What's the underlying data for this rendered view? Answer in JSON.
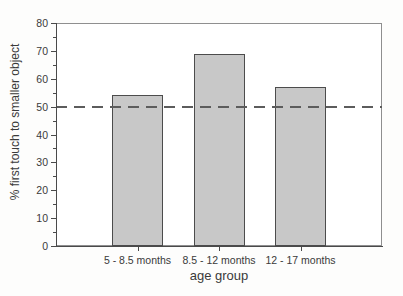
{
  "chart_data": {
    "type": "bar",
    "title": "",
    "xlabel": "age group",
    "ylabel": "% first touch to smaller object",
    "categories": [
      "5 - 8.5 months",
      "8.5 - 12 months",
      "12 - 17 months"
    ],
    "values": [
      54,
      69,
      57
    ],
    "ylim": [
      0,
      80
    ],
    "y_major_tick_step": 10,
    "y_minor_tick_step": 5,
    "y_tick_labels": [
      "0",
      "10",
      "20",
      "30",
      "40",
      "50",
      "60",
      "70",
      "80"
    ],
    "reference_line": {
      "value": 50,
      "style": "dashed"
    },
    "grid": false,
    "legend": false,
    "colors": {
      "bar_fill": "#c8c8c8",
      "bar_border": "#4c4c4c",
      "frame": "#8f8f8f",
      "axis": "#4a4a4a",
      "dash": "#5c5c5c",
      "text": "#3a3a3a"
    }
  }
}
